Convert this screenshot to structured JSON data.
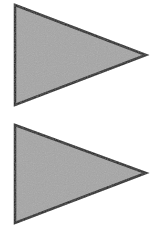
{
  "canvas": {
    "width": 161,
    "height": 236
  },
  "colors": {
    "background": "#ffffff",
    "shape_fill": "#a6a6a6",
    "shape_stroke": "#1f1f1f"
  },
  "shapes": [
    {
      "name": "right-pointing-triangle-top",
      "points": "15,5 146,55 15,105"
    },
    {
      "name": "right-pointing-triangle-bottom",
      "points": "15,125 146,173 15,223"
    }
  ]
}
